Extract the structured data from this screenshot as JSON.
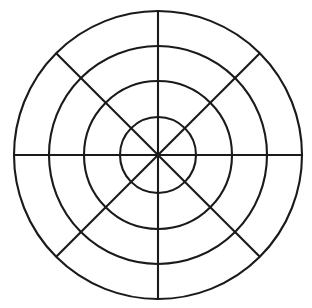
{
  "figure": {
    "name": "polar-grid",
    "background_color": "#ffffff",
    "width": 312,
    "height": 308
  },
  "chart_data": {
    "type": "line",
    "title": "",
    "subtitle": "",
    "xlabel": "",
    "ylabel": "",
    "grid": true,
    "legend": false,
    "legend_position": "none",
    "projection": "polar",
    "center": {
      "x": 158,
      "y": 155
    },
    "stroke_color": "#1a1a1a",
    "stroke_width": 2.1,
    "radial_gridlines": {
      "count": 4,
      "radii_px": [
        38,
        74,
        109,
        144
      ],
      "radii_normalized": [
        0.264,
        0.514,
        0.757,
        1.0
      ],
      "labels": [
        "",
        "",
        "",
        ""
      ]
    },
    "angular_gridlines": {
      "count": 8,
      "spacing_degrees": 45,
      "angles_degrees": [
        0,
        45,
        90,
        135,
        180,
        225,
        270,
        315
      ],
      "tick_labels": [
        "",
        "",
        "",
        "",
        "",
        "",
        "",
        ""
      ],
      "drawn_as_diameters": 4
    },
    "sectors": 8,
    "rings": 4,
    "series": [],
    "annotations": [],
    "x": [],
    "values": []
  }
}
